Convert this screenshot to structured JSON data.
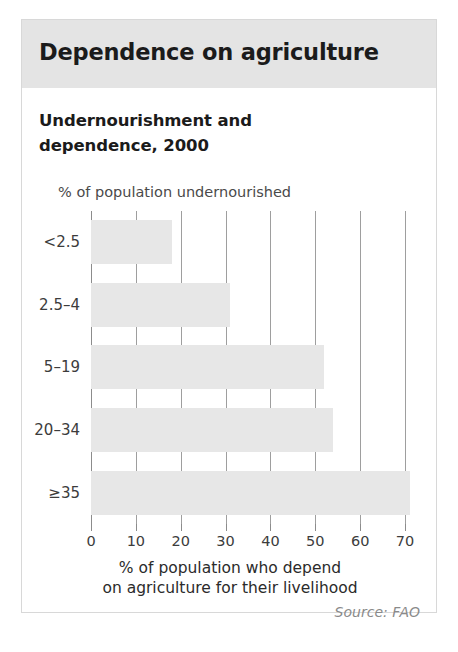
{
  "card": {
    "title": "Dependence on agriculture",
    "subtitle": "Undernourishment and dependence, 2000",
    "source": "Source: FAO"
  },
  "colors": {
    "header_band": "#e4e4e4",
    "bar_fill": "#e7e7e7",
    "gridline": "#9e9e9e",
    "card_border": "#d8d8d8",
    "title_text": "#1b1b1b",
    "source_text": "#8a8a8a"
  },
  "chart_data": {
    "type": "bar",
    "orientation": "horizontal",
    "title": "Undernourishment and dependence, 2000",
    "subtitle": "Dependence on agriculture",
    "categories": [
      "<2.5",
      "2.5–4",
      "5–19",
      "20–34",
      "≥35"
    ],
    "values": [
      18,
      31,
      52,
      54,
      71
    ],
    "xlabel": "% of population who depend on agriculture for their livelihood",
    "xlabel_line1": "% of population who depend",
    "xlabel_line2": "on agriculture for their livelihood",
    "ylabel": "% of population undernourished",
    "xlim": [
      0,
      74
    ],
    "xticks": [
      0,
      10,
      20,
      30,
      40,
      50,
      60,
      70
    ],
    "xtick_labels": [
      "0",
      "10",
      "20",
      "30",
      "40",
      "50",
      "60",
      "70"
    ],
    "grid": "vertical",
    "legend": "none",
    "source": "Source: FAO"
  }
}
